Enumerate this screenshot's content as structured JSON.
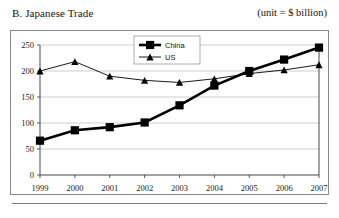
{
  "header": {
    "title": "B. Japanese Trade",
    "unit_note": "(unit = $ billion)"
  },
  "footer": {
    "rule": ""
  },
  "chart_data": {
    "type": "line",
    "title": "B. Japanese Trade",
    "subtitle": "(unit = $ billion)",
    "xlabel": "",
    "ylabel": "",
    "unit": "$ billion",
    "categories": [
      "1999",
      "2000",
      "2001",
      "2002",
      "2003",
      "2004",
      "2005",
      "2006",
      "2007"
    ],
    "x": [
      1999,
      2000,
      2001,
      2002,
      2003,
      2004,
      2005,
      2006,
      2007
    ],
    "series": [
      {
        "name": "China",
        "marker": "square",
        "line_weight": "thick",
        "color": "#000000",
        "values": [
          66,
          86,
          92,
          101,
          134,
          172,
          200,
          222,
          245
        ]
      },
      {
        "name": "US",
        "marker": "triangle",
        "line_weight": "thin",
        "color": "#000000",
        "values": [
          200,
          218,
          190,
          182,
          178,
          185,
          195,
          202,
          212
        ]
      }
    ],
    "ylim": [
      0,
      250
    ],
    "yticks": [
      0,
      50,
      100,
      150,
      200,
      250
    ],
    "ytick_labels": [
      "0",
      "50",
      "100",
      "150",
      "200",
      "250"
    ],
    "xtick_labels": [
      "1999",
      "2000",
      "2001",
      "2002",
      "2003",
      "2004",
      "2005",
      "2006",
      "2007"
    ],
    "grid": true,
    "grid_axis": "y",
    "legend_position": "top-center",
    "legend_entries": [
      "China",
      "US"
    ]
  }
}
